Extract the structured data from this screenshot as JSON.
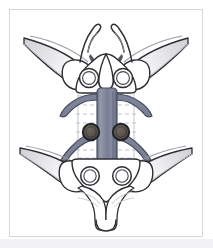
{
  "card": {
    "border_color": "#d7d7d7",
    "background": "#ffffff",
    "bottom_band_color": "#f2f2f6"
  },
  "illustration": {
    "title": "Vertebra with spinal cord and nerve roots (posterior view)",
    "type": "line-drawing-anatomical",
    "view": "posterior",
    "palette": {
      "bone_fill": "#ffffff",
      "bone_outline": "#2e2e33",
      "bone_shadow": "#c9c9cf",
      "cord_light": "#8b90a3",
      "cord_mid": "#767c92",
      "cord_dark": "#5e6479",
      "cord_outline": "#4a4f62",
      "nerve_fill": "#7d8296",
      "nerve_outline": "#474c5e",
      "foramen_fill": "#5b554f",
      "foramen_ring": "#22242b",
      "dashed_line": "#b9bcc6"
    },
    "parts": [
      {
        "name": "spinal-cord",
        "label": "Spinal cord",
        "count": 1
      },
      {
        "name": "nerve-root-upper-left",
        "label": "Upper left nerve root",
        "count": 1
      },
      {
        "name": "nerve-root-upper-right",
        "label": "Upper right nerve root",
        "count": 1
      },
      {
        "name": "nerve-root-lower-left",
        "label": "Lower left nerve root",
        "count": 1
      },
      {
        "name": "nerve-root-lower-right",
        "label": "Lower right nerve root",
        "count": 1
      },
      {
        "name": "facet-opening-upper-left",
        "label": "Upper left facet opening",
        "count": 1
      },
      {
        "name": "facet-opening-upper-right",
        "label": "Upper right facet opening",
        "count": 1
      },
      {
        "name": "facet-opening-lower-left",
        "label": "Lower left facet opening",
        "count": 1
      },
      {
        "name": "facet-opening-lower-right",
        "label": "Lower right facet opening",
        "count": 1
      },
      {
        "name": "foramen-left",
        "label": "Left dark foramen",
        "count": 1
      },
      {
        "name": "foramen-right",
        "label": "Right dark foramen",
        "count": 1
      },
      {
        "name": "rib-upper-left",
        "label": "Upper left rib / transverse process",
        "count": 1
      },
      {
        "name": "rib-upper-right",
        "label": "Upper right rib / transverse process",
        "count": 1
      },
      {
        "name": "rib-lower-left",
        "label": "Lower left rib / transverse process",
        "count": 1
      },
      {
        "name": "rib-lower-right",
        "label": "Lower right rib / transverse process",
        "count": 1
      },
      {
        "name": "spinous-process",
        "label": "Spinous process",
        "count": 1
      },
      {
        "name": "vertebral-body-striations",
        "label": "Vertebral body dashed striations",
        "count": 8
      }
    ]
  }
}
